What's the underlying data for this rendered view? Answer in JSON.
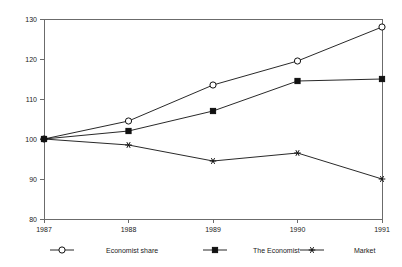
{
  "chart_data": {
    "type": "line",
    "title": "",
    "subtitle": "",
    "xlabel": "",
    "ylabel": "",
    "categories": [
      "1987",
      "1988",
      "1989",
      "1990",
      "1991"
    ],
    "x": [
      1987,
      1988,
      1989,
      1990,
      1991
    ],
    "xlim": [
      1987,
      1991
    ],
    "ylim": [
      80,
      130
    ],
    "yticks": [
      80,
      90,
      100,
      110,
      120,
      130
    ],
    "ytick_labels": [
      "80",
      "90",
      "100",
      "110",
      "120",
      "130"
    ],
    "xticks": [
      1987,
      1988,
      1989,
      1990,
      1991
    ],
    "xtick_labels": [
      "1987",
      "1988",
      "1989",
      "1990",
      "1991"
    ],
    "grid": false,
    "legend_position": "bottom",
    "series": [
      {
        "name": "Economist share",
        "marker": "open-circle",
        "color": "#111111",
        "values": [
          100,
          104.5,
          113.5,
          119.5,
          128
        ]
      },
      {
        "name": "The Economist",
        "marker": "filled-square",
        "color": "#111111",
        "values": [
          100,
          102,
          107,
          114.5,
          115
        ]
      },
      {
        "name": "Market",
        "marker": "star",
        "color": "#111111",
        "values": [
          100,
          98.5,
          94.5,
          96.5,
          90
        ]
      }
    ]
  },
  "legend": {
    "items": [
      {
        "label": "Economist share",
        "marker": "open-circle"
      },
      {
        "label": "The Economist",
        "marker": "filled-square"
      },
      {
        "label": "Market",
        "marker": "star"
      }
    ]
  }
}
